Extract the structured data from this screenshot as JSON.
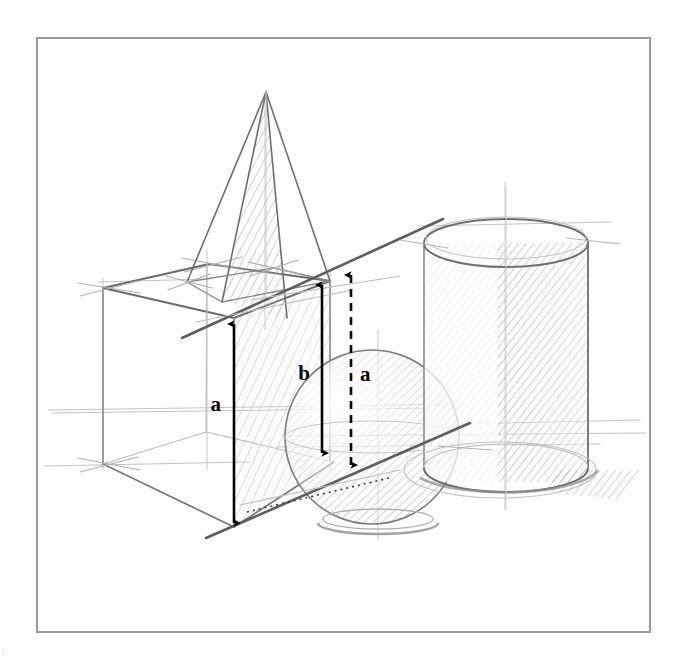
{
  "page": {
    "background_color": "#ffffff",
    "width": 688,
    "height": 669
  },
  "frame": {
    "name": "drawing-border",
    "color": "#9a9a9a",
    "x": 37,
    "y": 38,
    "width": 613,
    "height": 594,
    "stroke_width": 2
  },
  "drawing": {
    "medium": "graphite pencil",
    "paper_color": "#ffffff",
    "line_color_dark": "#4a4a4a",
    "line_color_mid": "#7d7d7d",
    "line_color_light": "#b8b8b8",
    "shading_color": "#9e9e9e",
    "annotation_color": "#000000",
    "subjects": [
      {
        "name": "cube",
        "description": "wireframe cube in two-point perspective, lower left"
      },
      {
        "name": "pyramid",
        "description": "square pyramid standing on the cube top face, hatched right face"
      },
      {
        "name": "sphere",
        "description": "sphere centred in the scene, hatched right hemisphere"
      },
      {
        "name": "cylinder",
        "description": "upright cylinder at right, hatched right side with cast shadow"
      },
      {
        "name": "horizon-lines",
        "description": "faint horizontal construction / horizon lines across the scene"
      },
      {
        "name": "diagonal-line",
        "description": "bold diagonal straightedge line rising from lower left to upper right"
      }
    ]
  },
  "annotations": {
    "measure_arrows": [
      {
        "id": "arrow-a-left",
        "label": "a",
        "style": "solid",
        "heads": "double",
        "x": 234,
        "y_top": 320,
        "y_bottom": 527,
        "label_x": 221,
        "label_y": 411,
        "label_anchor": "end"
      },
      {
        "id": "arrow-b-middle",
        "label": "b",
        "style": "solid",
        "heads": "double",
        "x": 322,
        "y_top": 281,
        "y_bottom": 457,
        "label_x": 310,
        "label_y": 380,
        "label_anchor": "end"
      },
      {
        "id": "arrow-a-right",
        "label": "a",
        "style": "dashed",
        "heads": "double",
        "x": 351,
        "y_top": 271,
        "y_bottom": 469,
        "label_x": 360,
        "label_y": 381,
        "label_anchor": "start"
      }
    ],
    "dotted_guide": {
      "id": "dotted-base-guide",
      "style": "dotted",
      "x1": 247,
      "y1": 512,
      "x2": 389,
      "y2": 478
    },
    "label_font_size": 21
  }
}
